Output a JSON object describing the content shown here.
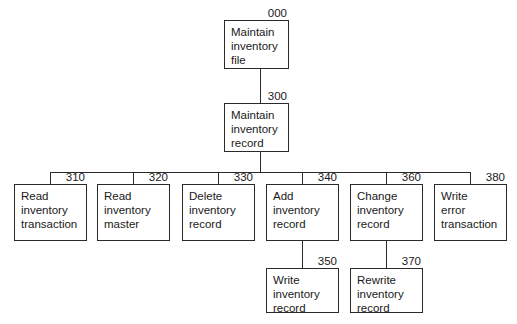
{
  "diagram": {
    "type": "structure-chart",
    "nodes": [
      {
        "id": "000",
        "label": "Maintain\ninventory\nfile",
        "x": 224,
        "y": 20,
        "w": 65,
        "h": 49
      },
      {
        "id": "300",
        "label": "Maintain\ninventory\nrecord",
        "x": 224,
        "y": 103,
        "w": 65,
        "h": 49
      },
      {
        "id": "310",
        "label": "Read\ninventory\ntransaction",
        "x": 14,
        "y": 184,
        "w": 73,
        "h": 57
      },
      {
        "id": "320",
        "label": "Read\ninventory\nmaster",
        "x": 97,
        "y": 184,
        "w": 73,
        "h": 57
      },
      {
        "id": "330",
        "label": "Delete\ninventory\nrecord",
        "x": 182,
        "y": 184,
        "w": 73,
        "h": 57
      },
      {
        "id": "340",
        "label": "Add\ninventory\nrecord",
        "x": 266,
        "y": 184,
        "w": 73,
        "h": 57
      },
      {
        "id": "360",
        "label": "Change\ninventory\nrecord",
        "x": 350,
        "y": 184,
        "w": 73,
        "h": 57
      },
      {
        "id": "380",
        "label": "Write\nerror\ntransaction",
        "x": 434,
        "y": 184,
        "w": 73,
        "h": 57
      },
      {
        "id": "350",
        "label": "Write\ninventory\nrecord",
        "x": 266,
        "y": 268,
        "w": 73,
        "h": 45
      },
      {
        "id": "370",
        "label": "Rewrite\ninventory\nrecord",
        "x": 350,
        "y": 268,
        "w": 73,
        "h": 45
      }
    ],
    "edges": [
      {
        "from": "000",
        "to": "300"
      },
      {
        "from": "300",
        "to": "310"
      },
      {
        "from": "300",
        "to": "320"
      },
      {
        "from": "300",
        "to": "330"
      },
      {
        "from": "300",
        "to": "340"
      },
      {
        "from": "300",
        "to": "360"
      },
      {
        "from": "300",
        "to": "380"
      },
      {
        "from": "340",
        "to": "350"
      },
      {
        "from": "360",
        "to": "370"
      }
    ]
  }
}
